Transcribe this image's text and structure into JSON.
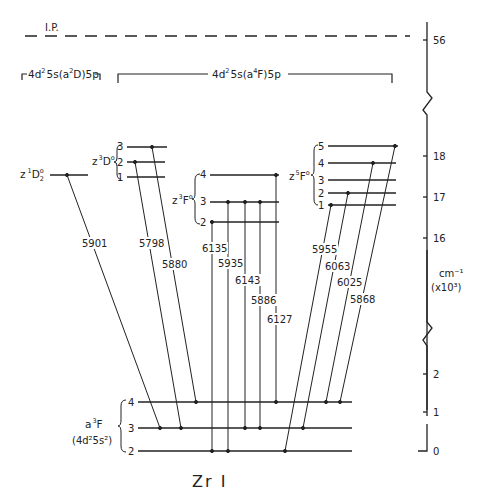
{
  "diagram": {
    "title": "Zr I",
    "ionization": {
      "label": "I.P.",
      "value_tick": "56"
    },
    "configurations": {
      "left": {
        "label_pre": "4d",
        "label_sup1": "2",
        "label_mid": "5s(a",
        "label_sup2": "2",
        "label_post": "D)5p"
      },
      "right": {
        "label_pre": "4d",
        "label_sup1": "2",
        "label_mid": "5s(a",
        "label_sup2": "4",
        "label_post": "F)5p"
      }
    },
    "upper_terms": [
      {
        "id": "z1D2",
        "label_pre": "z",
        "label_sup": "1",
        "label_main": "D",
        "label_sub": "2",
        "label_sup2": "o",
        "levels": [
          {
            "J": ""
          }
        ]
      },
      {
        "id": "z3D",
        "label_pre": "z",
        "label_sup": "3",
        "label_main": "D",
        "label_sup2": "o",
        "levels": [
          {
            "J": "3"
          },
          {
            "J": "2"
          },
          {
            "J": "1"
          }
        ]
      },
      {
        "id": "z3F",
        "label_pre": "z",
        "label_sup": "3",
        "label_main": "F",
        "label_sup2": "o",
        "levels": [
          {
            "J": "4"
          },
          {
            "J": "3"
          },
          {
            "J": "2"
          }
        ]
      },
      {
        "id": "z5F",
        "label_pre": "z",
        "label_sup": "5",
        "label_main": "F",
        "label_sup2": "o",
        "levels": [
          {
            "J": "5"
          },
          {
            "J": "4"
          },
          {
            "J": "3"
          },
          {
            "J": "2"
          },
          {
            "J": "1"
          }
        ]
      }
    ],
    "ground_term": {
      "label_pre": "a",
      "label_sup": "3",
      "label_main": "F",
      "config": "(4d²5s²)",
      "levels": [
        {
          "J": "4"
        },
        {
          "J": "3"
        },
        {
          "J": "2"
        }
      ]
    },
    "transitions": [
      {
        "wavelength": "5901",
        "from": "z1D2",
        "to": "a3F3"
      },
      {
        "wavelength": "5798",
        "from": "z3D2",
        "to": "a3F3"
      },
      {
        "wavelength": "5880",
        "from": "z3D3",
        "to": "a3F4"
      },
      {
        "wavelength": "6135",
        "from": "z3F2",
        "to": "a3F2"
      },
      {
        "wavelength": "5935",
        "from": "z3F3",
        "to": "a3F2"
      },
      {
        "wavelength": "6143",
        "from": "z3F3",
        "to": "a3F3"
      },
      {
        "wavelength": "5886",
        "from": "z3F3",
        "to": "a3F3"
      },
      {
        "wavelength": "6127",
        "from": "z3F4",
        "to": "a3F4"
      },
      {
        "wavelength": "5955",
        "from": "z5F1",
        "to": "a3F2"
      },
      {
        "wavelength": "6063",
        "from": "z5F2",
        "to": "a3F3"
      },
      {
        "wavelength": "6025",
        "from": "z5F4",
        "to": "a3F4"
      },
      {
        "wavelength": "5868",
        "from": "z5F5",
        "to": "a3F4"
      }
    ],
    "energy_axis": {
      "unit_line1": "cm⁻¹",
      "unit_line2": "(x10³)",
      "ticks_upper": [
        "56"
      ],
      "ticks_middle": [
        "18",
        "17",
        "16"
      ],
      "ticks_lower": [
        "2",
        "1",
        "0"
      ],
      "breaks": 2
    }
  }
}
